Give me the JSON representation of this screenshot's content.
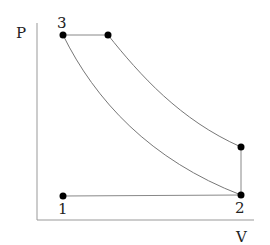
{
  "diagram": {
    "type": "P-V thermodynamic cycle",
    "axes": {
      "y_label": "P",
      "x_label": "V"
    },
    "points": [
      {
        "id": "1",
        "label": "1",
        "x": 63,
        "y": 196
      },
      {
        "id": "2",
        "label": "2",
        "x": 241,
        "y": 195
      },
      {
        "id": "3",
        "label": "3",
        "x": 63,
        "y": 35
      },
      {
        "id": "4",
        "label": "",
        "x": 108,
        "y": 35
      },
      {
        "id": "5",
        "label": "",
        "x": 241,
        "y": 147
      }
    ],
    "colors": {
      "line": "#888888",
      "point": "#000000",
      "axis": "#999999"
    }
  }
}
